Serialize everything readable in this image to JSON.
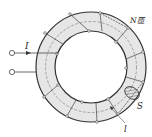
{
  "diagram": {
    "type": "toroidal-coil",
    "labels": {
      "current": "I",
      "turns": "N匝",
      "cross_section": "S",
      "path_length": "l"
    },
    "colors": {
      "ring_fill": "#e8e8e8",
      "stroke": "#333333",
      "hatch": "#555555"
    }
  }
}
